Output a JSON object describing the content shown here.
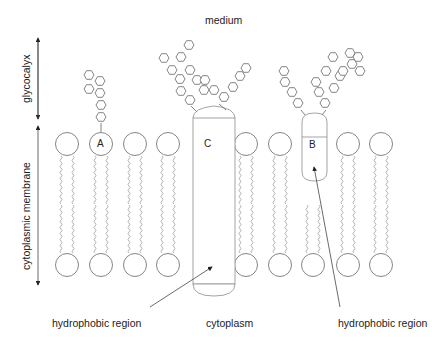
{
  "labels": {
    "medium": "medium",
    "glycocalyx": "glycocalyx",
    "membrane": "cytoplasmic membrane",
    "hydrophobic_left": "hydrophobic region",
    "cytoplasm": "cytoplasm",
    "hydrophobic_right": "hydrophobic region",
    "A": "A",
    "B": "B",
    "C": "C"
  },
  "colors": {
    "line": "#777777",
    "tail": "#aaaaaa",
    "text": "#222222"
  },
  "components": [
    {
      "id": "A",
      "type": "glycolipid"
    },
    {
      "id": "B",
      "type": "peripheral glycoprotein"
    },
    {
      "id": "C",
      "type": "transmembrane glycoprotein"
    }
  ]
}
